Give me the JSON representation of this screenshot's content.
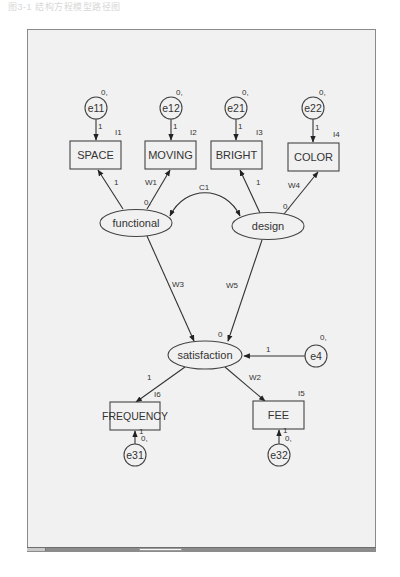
{
  "caption": "图3-1 结构方程模型路径图",
  "colors": {
    "panel_bg": "#f1f1f1",
    "stroke": "#333333",
    "border": "#8a8a8a"
  },
  "observed": [
    {
      "id": "SPACE",
      "label": "SPACE",
      "intercept": "I1"
    },
    {
      "id": "MOVING",
      "label": "MOVING",
      "intercept": "I2"
    },
    {
      "id": "BRIGHT",
      "label": "BRIGHT",
      "intercept": "I3"
    },
    {
      "id": "COLOR",
      "label": "COLOR",
      "intercept": "I4"
    },
    {
      "id": "FREQUENCY",
      "label": "FREQUENCY",
      "intercept": "I6"
    },
    {
      "id": "FEE",
      "label": "FEE",
      "intercept": "I5"
    }
  ],
  "latent": [
    {
      "id": "functional",
      "label": "functional",
      "mean": "0,"
    },
    {
      "id": "design",
      "label": "design",
      "mean": "0,"
    },
    {
      "id": "satisfaction",
      "label": "satisfaction",
      "mean": "0"
    }
  ],
  "errors": [
    {
      "id": "e11",
      "label": "e11",
      "mean": "0,",
      "weight": "1"
    },
    {
      "id": "e12",
      "label": "e12",
      "mean": "0,",
      "weight": "1"
    },
    {
      "id": "e21",
      "label": "e21",
      "mean": "0,",
      "weight": "1"
    },
    {
      "id": "e22",
      "label": "e22",
      "mean": "0,",
      "weight": "1"
    },
    {
      "id": "e4",
      "label": "e4",
      "mean": "0,",
      "weight": "1"
    },
    {
      "id": "e31",
      "label": "e31",
      "mean": "0,",
      "weight": "1"
    },
    {
      "id": "e32",
      "label": "e32",
      "mean": "0,",
      "weight": "1"
    }
  ],
  "paths": {
    "functional_space": "1",
    "functional_moving": "W1",
    "design_bright": "1",
    "design_color": "W4",
    "functional_design_cov": "C1",
    "functional_satisfaction": "W3",
    "design_satisfaction": "W5",
    "satisfaction_frequency": "1",
    "satisfaction_fee": "W2"
  },
  "scrollbar": {
    "thumb_position": "center-left"
  }
}
